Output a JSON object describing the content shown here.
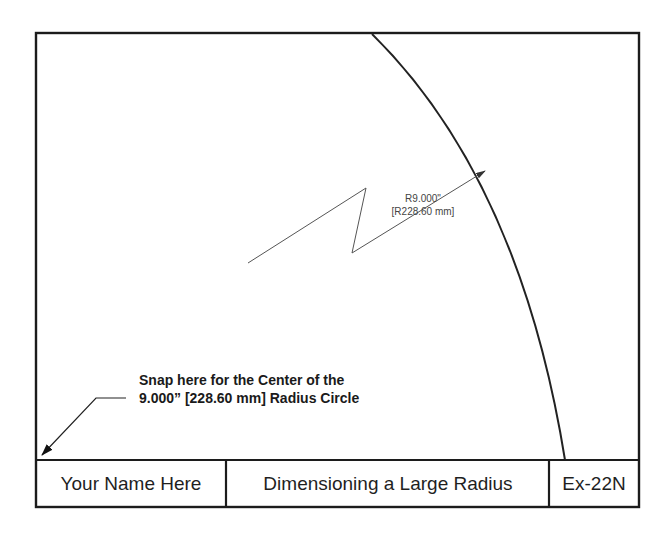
{
  "drawing": {
    "dimension": {
      "label_inch": "R9.000\"",
      "label_mm": "[R228.60 mm]"
    },
    "note": {
      "line1": "Snap here for the Center of the",
      "line2": "9.000” [228.60 mm] Radius Circle"
    },
    "title_block": {
      "name": "Your Name Here",
      "title": "Dimensioning a Large Radius",
      "number": "Ex-22N"
    },
    "colors": {
      "line": "#1c1c1c",
      "dimension": "#555555",
      "background": "#ffffff"
    }
  }
}
